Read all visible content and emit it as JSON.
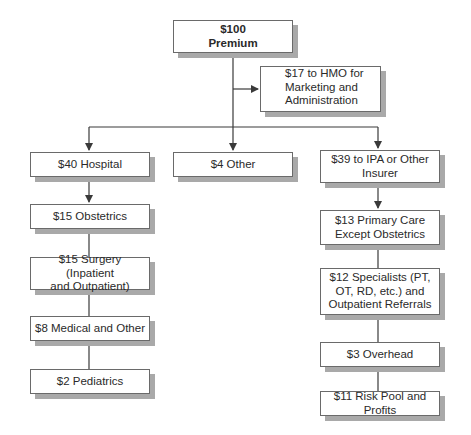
{
  "diagram": {
    "root": {
      "amount": "$100",
      "label": "Premium"
    },
    "side": {
      "line1": "$17 to HMO for",
      "line2": "Marketing and",
      "line3": "Administration"
    },
    "branches": {
      "hospital": {
        "label": "$40 Hospital",
        "children": [
          {
            "line1": "$15 Obstetrics"
          },
          {
            "line1": "$15 Surgery (Inpatient",
            "line2": "and Outpatient)"
          },
          {
            "line1": "$8 Medical and Other"
          },
          {
            "line1": "$2 Pediatrics"
          }
        ]
      },
      "other": {
        "label": "$4 Other"
      },
      "ipa": {
        "line1": "$39 to IPA or Other",
        "line2": "Insurer",
        "children": [
          {
            "line1": "$13 Primary Care",
            "line2": "Except Obstetrics"
          },
          {
            "line1": "$12 Specialists (PT,",
            "line2": "OT, RD, etc.) and",
            "line3": "Outpatient Referrals"
          },
          {
            "line1": "$3 Overhead"
          },
          {
            "line1": "$11 Risk Pool and Profits"
          }
        ]
      }
    },
    "colors": {
      "line": "#3a3a3a",
      "border": "#6a6a6a",
      "shadow": "#a9a9a9"
    }
  }
}
